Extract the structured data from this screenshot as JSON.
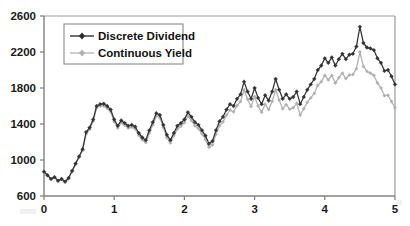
{
  "chart_data": {
    "type": "line",
    "title": "",
    "subtitle": "",
    "xlabel": "",
    "ylabel": "",
    "xlim": [
      0,
      5
    ],
    "ylim": [
      600,
      2600
    ],
    "xticks": [
      0,
      1,
      2,
      3,
      4,
      5
    ],
    "yticks": [
      600,
      1000,
      1400,
      1800,
      2200,
      2600
    ],
    "xtick_labels": [
      "0",
      "1",
      "2",
      "3",
      "4",
      "5"
    ],
    "ytick_labels": [
      "600",
      "1000",
      "1400",
      "1800",
      "2200",
      "2600"
    ],
    "grid": false,
    "legend_position": "upper-left-inside",
    "colors": {
      "discrete_dividend": "#333333",
      "continuous_yield": "#b0b0b0",
      "axis": "#808080",
      "text": "#1a1a1a",
      "background": "#ffffff"
    },
    "marker": "diamond",
    "x": [
      0.0,
      0.05,
      0.1,
      0.15,
      0.2,
      0.25,
      0.3,
      0.35,
      0.4,
      0.45,
      0.5,
      0.55,
      0.6,
      0.65,
      0.7,
      0.75,
      0.8,
      0.85,
      0.9,
      0.95,
      1.0,
      1.05,
      1.1,
      1.15,
      1.2,
      1.25,
      1.3,
      1.35,
      1.4,
      1.45,
      1.5,
      1.55,
      1.6,
      1.65,
      1.7,
      1.75,
      1.8,
      1.85,
      1.9,
      1.95,
      2.0,
      2.05,
      2.1,
      2.15,
      2.2,
      2.25,
      2.3,
      2.35,
      2.4,
      2.45,
      2.5,
      2.55,
      2.6,
      2.65,
      2.7,
      2.75,
      2.8,
      2.85,
      2.9,
      2.95,
      3.0,
      3.05,
      3.1,
      3.15,
      3.2,
      3.25,
      3.3,
      3.35,
      3.4,
      3.45,
      3.5,
      3.55,
      3.6,
      3.65,
      3.7,
      3.75,
      3.8,
      3.85,
      3.9,
      3.95,
      4.0,
      4.05,
      4.1,
      4.15,
      4.2,
      4.25,
      4.3,
      4.35,
      4.4,
      4.45,
      4.5,
      4.55,
      4.6,
      4.65,
      4.7,
      4.75,
      4.8,
      4.85,
      4.9,
      4.95,
      5.0
    ],
    "series": [
      {
        "name": "Discrete Dividend",
        "color": "#333333",
        "values": [
          870,
          830,
          790,
          810,
          770,
          790,
          760,
          800,
          880,
          960,
          1040,
          1120,
          1310,
          1360,
          1450,
          1600,
          1620,
          1625,
          1600,
          1560,
          1450,
          1380,
          1440,
          1410,
          1380,
          1390,
          1370,
          1300,
          1250,
          1220,
          1330,
          1420,
          1520,
          1500,
          1390,
          1280,
          1220,
          1300,
          1380,
          1410,
          1450,
          1530,
          1480,
          1420,
          1390,
          1330,
          1270,
          1180,
          1210,
          1330,
          1430,
          1480,
          1560,
          1620,
          1600,
          1680,
          1730,
          1870,
          1760,
          1680,
          1800,
          1690,
          1620,
          1720,
          1660,
          1760,
          1900,
          1780,
          1680,
          1730,
          1680,
          1700,
          1760,
          1620,
          1700,
          1780,
          1840,
          1900,
          2000,
          2050,
          2130,
          2080,
          2140,
          2050,
          2120,
          2180,
          2120,
          2170,
          2180,
          2260,
          2480,
          2300,
          2250,
          2240,
          2220,
          2130,
          2080,
          1990,
          2000,
          1930,
          1840
        ]
      },
      {
        "name": "Continuous Yield",
        "color": "#b0b0b0",
        "values": [
          870,
          830,
          790,
          805,
          765,
          785,
          755,
          795,
          870,
          950,
          1030,
          1105,
          1290,
          1340,
          1430,
          1580,
          1600,
          1600,
          1575,
          1535,
          1425,
          1355,
          1415,
          1385,
          1355,
          1365,
          1345,
          1275,
          1225,
          1195,
          1300,
          1390,
          1490,
          1470,
          1360,
          1250,
          1190,
          1270,
          1345,
          1375,
          1415,
          1490,
          1440,
          1380,
          1350,
          1290,
          1230,
          1140,
          1170,
          1285,
          1380,
          1425,
          1500,
          1555,
          1535,
          1605,
          1650,
          1780,
          1675,
          1595,
          1705,
          1600,
          1530,
          1620,
          1560,
          1650,
          1780,
          1665,
          1570,
          1615,
          1565,
          1580,
          1630,
          1500,
          1570,
          1640,
          1690,
          1740,
          1830,
          1870,
          1940,
          1890,
          1940,
          1855,
          1915,
          1965,
          1905,
          1945,
          1950,
          2015,
          2200,
          2040,
          1985,
          1965,
          1940,
          1855,
          1800,
          1715,
          1720,
          1650,
          1580
        ]
      }
    ]
  },
  "legend": {
    "items": [
      {
        "label": "Discrete Dividend",
        "color": "#333333"
      },
      {
        "label": "Continuous Yield",
        "color": "#b0b0b0"
      }
    ]
  }
}
